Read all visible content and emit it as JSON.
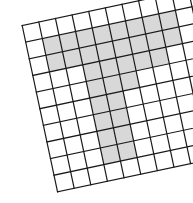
{
  "figure": {
    "name": "rotated-square-grid-with-shaded-digit",
    "background_color": "#ffffff",
    "line_color": "#1a1a1a",
    "cell_fill_color": "#d8d8d8",
    "cell_empty_color": "#ffffff",
    "line_width": 1.2,
    "rotation_degrees": -12
  },
  "chart_data": {
    "type": "heatmap",
    "title": "",
    "subtitle": "",
    "xlabel": "",
    "ylabel": "",
    "grid": true,
    "legend_position": "none",
    "rows": 10,
    "cols": 10,
    "cell_size": 17,
    "origin_x": 38,
    "origin_y": 6,
    "value_legend": {
      "0": "empty",
      "1": "shaded"
    },
    "tick_labels_x": [],
    "tick_labels_y": [],
    "values": [
      [
        0,
        0,
        0,
        0,
        0,
        0,
        0,
        0,
        0,
        0
      ],
      [
        0,
        1,
        1,
        1,
        1,
        1,
        1,
        1,
        1,
        0
      ],
      [
        0,
        1,
        1,
        1,
        1,
        1,
        1,
        1,
        1,
        0
      ],
      [
        0,
        0,
        0,
        1,
        1,
        1,
        1,
        1,
        0,
        0
      ],
      [
        0,
        0,
        0,
        1,
        1,
        1,
        0,
        0,
        0,
        0
      ],
      [
        0,
        0,
        0,
        1,
        1,
        0,
        0,
        0,
        0,
        0
      ],
      [
        0,
        0,
        0,
        1,
        1,
        0,
        0,
        0,
        0,
        0
      ],
      [
        0,
        0,
        0,
        1,
        1,
        0,
        0,
        0,
        0,
        0
      ],
      [
        0,
        0,
        0,
        1,
        1,
        0,
        0,
        0,
        0,
        0
      ],
      [
        0,
        0,
        0,
        0,
        0,
        0,
        0,
        0,
        0,
        0
      ]
    ]
  }
}
